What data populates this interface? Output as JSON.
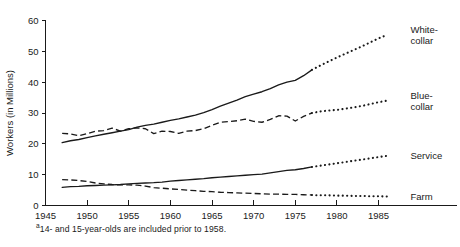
{
  "chart_data": {
    "type": "line",
    "title": "",
    "xlabel": "",
    "ylabel": "Workers (in Millions)",
    "xlim": [
      1945,
      1988
    ],
    "ylim": [
      0,
      60
    ],
    "grid": false,
    "legend_position": "right-inline-labels",
    "x_ticks": [
      "1945",
      "1950",
      "1955",
      "1960",
      "1965",
      "1970",
      "1975",
      "1980",
      "1985"
    ],
    "x_tick_values": [
      1945,
      1950,
      1955,
      1960,
      1965,
      1970,
      1975,
      1980,
      1985
    ],
    "y_ticks": [
      "0",
      "10",
      "20",
      "30",
      "40",
      "50",
      "60"
    ],
    "y_tick_values": [
      0,
      10,
      20,
      30,
      40,
      50,
      60
    ],
    "projection_start_year": 1977,
    "footnote": "14- and 15-year-olds are included prior to 1958.",
    "footnote_marker": "a",
    "series": [
      {
        "name": "White-collar",
        "label": "White-",
        "label_line2": "collar",
        "style": "solid",
        "projection_style": "dotted",
        "x": [
          1947,
          1948,
          1949,
          1950,
          1951,
          1952,
          1953,
          1954,
          1955,
          1956,
          1957,
          1958,
          1959,
          1960,
          1961,
          1962,
          1963,
          1964,
          1965,
          1966,
          1967,
          1968,
          1969,
          1970,
          1971,
          1972,
          1973,
          1974,
          1975,
          1976,
          1977,
          1978,
          1979,
          1980,
          1981,
          1982,
          1983,
          1984,
          1985,
          1986
        ],
        "values": [
          20.4,
          21.0,
          21.4,
          22.0,
          22.6,
          23.1,
          23.6,
          24.1,
          24.6,
          25.4,
          26.0,
          26.4,
          27.0,
          27.6,
          28.1,
          28.7,
          29.3,
          30.1,
          31.1,
          32.2,
          33.2,
          34.2,
          35.3,
          36.1,
          36.9,
          37.9,
          39.1,
          40.0,
          40.6,
          42.1,
          44.0,
          45.4,
          46.7,
          48.0,
          49.2,
          50.4,
          51.6,
          52.9,
          54.2,
          55.3
        ],
        "start_value": 20.4,
        "end_value": 55.3
      },
      {
        "name": "Blue-collar",
        "label": "Blue-",
        "label_line2": "collar",
        "style": "dashed",
        "projection_style": "dotted",
        "x": [
          1947,
          1948,
          1949,
          1950,
          1951,
          1952,
          1953,
          1954,
          1955,
          1956,
          1957,
          1958,
          1959,
          1960,
          1961,
          1962,
          1963,
          1964,
          1965,
          1966,
          1967,
          1968,
          1969,
          1970,
          1971,
          1972,
          1973,
          1974,
          1975,
          1976,
          1977,
          1978,
          1979,
          1980,
          1981,
          1982,
          1983,
          1984,
          1985,
          1986
        ],
        "values": [
          23.4,
          23.2,
          22.6,
          23.3,
          24.1,
          24.3,
          25.1,
          24.1,
          24.9,
          25.2,
          24.9,
          23.3,
          24.1,
          24.0,
          23.4,
          24.1,
          24.3,
          24.9,
          26.0,
          27.0,
          27.2,
          27.5,
          28.0,
          27.3,
          27.0,
          27.9,
          29.1,
          29.0,
          27.4,
          28.9,
          30.0,
          30.5,
          30.8,
          31.0,
          31.4,
          31.8,
          32.3,
          32.9,
          33.5,
          34.0
        ],
        "start_value": 23.4,
        "end_value": 34.0
      },
      {
        "name": "Service",
        "label": "Service",
        "style": "solid",
        "projection_style": "dotted",
        "x": [
          1947,
          1948,
          1949,
          1950,
          1951,
          1952,
          1953,
          1954,
          1955,
          1956,
          1957,
          1958,
          1959,
          1960,
          1961,
          1962,
          1963,
          1964,
          1965,
          1966,
          1967,
          1968,
          1969,
          1970,
          1971,
          1972,
          1973,
          1974,
          1975,
          1976,
          1977,
          1978,
          1979,
          1980,
          1981,
          1982,
          1983,
          1984,
          1985,
          1986
        ],
        "values": [
          5.9,
          6.1,
          6.2,
          6.4,
          6.5,
          6.6,
          6.7,
          6.8,
          7.0,
          7.2,
          7.3,
          7.4,
          7.6,
          7.9,
          8.1,
          8.3,
          8.5,
          8.7,
          9.0,
          9.2,
          9.4,
          9.6,
          9.8,
          10.0,
          10.2,
          10.6,
          11.0,
          11.4,
          11.6,
          12.0,
          12.5,
          12.9,
          13.3,
          13.7,
          14.1,
          14.5,
          14.9,
          15.3,
          15.7,
          16.1
        ],
        "start_value": 5.9,
        "end_value": 16.1
      },
      {
        "name": "Farm",
        "label": "Farm",
        "style": "dashed",
        "projection_style": "dotted",
        "x": [
          1947,
          1948,
          1949,
          1950,
          1951,
          1952,
          1953,
          1954,
          1955,
          1956,
          1957,
          1958,
          1959,
          1960,
          1961,
          1962,
          1963,
          1964,
          1965,
          1966,
          1967,
          1968,
          1969,
          1970,
          1971,
          1972,
          1973,
          1974,
          1975,
          1976,
          1977,
          1978,
          1979,
          1980,
          1981,
          1982,
          1983,
          1984,
          1985,
          1986
        ],
        "values": [
          8.4,
          8.3,
          8.1,
          7.8,
          7.3,
          7.0,
          6.8,
          6.7,
          6.7,
          6.6,
          6.3,
          5.8,
          5.6,
          5.4,
          5.2,
          5.0,
          4.8,
          4.6,
          4.5,
          4.3,
          4.2,
          4.1,
          4.0,
          3.9,
          3.8,
          3.7,
          3.7,
          3.6,
          3.6,
          3.5,
          3.4,
          3.3,
          3.3,
          3.2,
          3.2,
          3.1,
          3.1,
          3.0,
          3.0,
          2.9
        ],
        "start_value": 8.4,
        "end_value": 2.9
      }
    ]
  }
}
